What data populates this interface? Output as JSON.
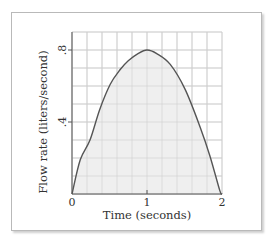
{
  "chart_data": {
    "type": "area",
    "title": "",
    "xlabel": "Time (seconds)",
    "ylabel": "Flow rate (liters/second)",
    "xlim": [
      0,
      2
    ],
    "ylim": [
      0,
      0.9
    ],
    "x_ticks": [
      0,
      1,
      2
    ],
    "x_tick_labels": [
      "0",
      "1",
      "2"
    ],
    "y_ticks": [
      0.4,
      0.8
    ],
    "y_tick_labels": [
      ".4",
      ".8"
    ],
    "grid": true,
    "grid_x_step": 0.2,
    "grid_y_step": 0.1,
    "legend": null,
    "series": [
      {
        "name": "Flow rate",
        "x": [
          0,
          0.11,
          0.24,
          0.37,
          0.51,
          0.64,
          0.75,
          0.88,
          1.0,
          1.13,
          1.31,
          1.51,
          1.71,
          1.84,
          1.97,
          2.0
        ],
        "values": [
          0,
          0.19,
          0.3,
          0.47,
          0.61,
          0.69,
          0.74,
          0.78,
          0.8,
          0.78,
          0.72,
          0.58,
          0.37,
          0.21,
          0.02,
          0
        ]
      }
    ],
    "colors": {
      "curve": "#555555",
      "fill": "#efefef",
      "grid": "#cfcfcf",
      "axis": "#555555",
      "frame": "#b9b9b9"
    }
  },
  "labels": {
    "xlabel": "Time (seconds)",
    "ylabel": "Flow rate (liters/second)",
    "x_tick_0": "0",
    "x_tick_1": "1",
    "x_tick_2": "2",
    "y_tick_04": ".4",
    "y_tick_08": ".8"
  }
}
